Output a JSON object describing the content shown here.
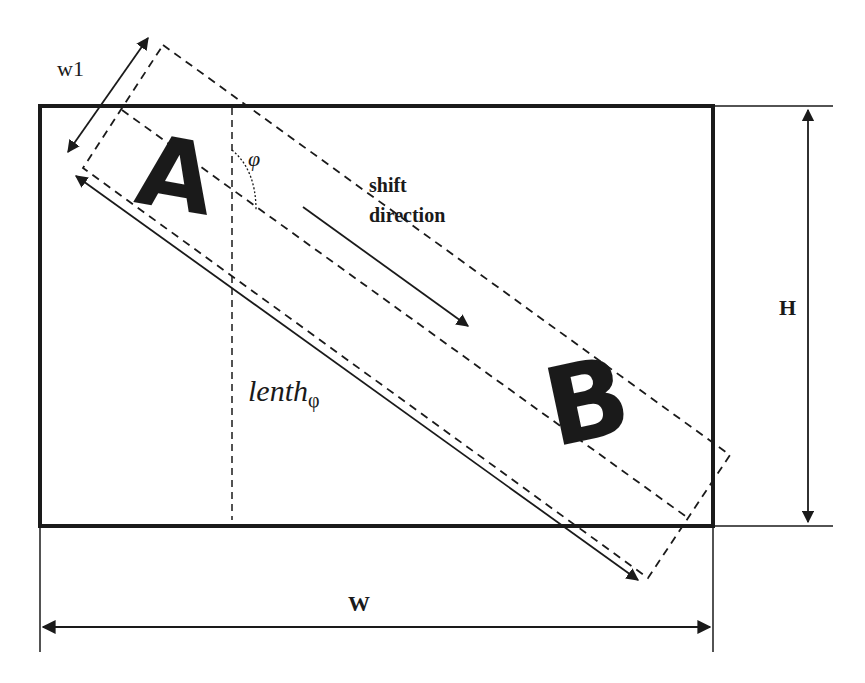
{
  "diagram": {
    "labels": {
      "w1": "w1",
      "phi": "φ",
      "shift_line1": "shift",
      "shift_line2": "direction",
      "lenth_main": "lenth",
      "lenth_sub": "φ",
      "H": "H",
      "W": "W"
    },
    "letters": {
      "A": "A",
      "B": "B"
    },
    "colors": {
      "stroke": "#1a1a1a",
      "background": "#ffffff"
    }
  }
}
